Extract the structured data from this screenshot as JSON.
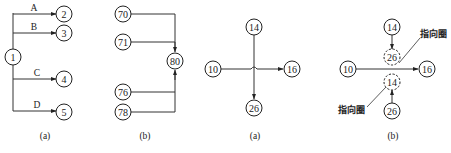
{
  "figures": [
    {
      "id": "fig1a",
      "caption": "(a)",
      "nodes": {
        "n1": "1",
        "n2": "2",
        "n3": "3",
        "n4": "4",
        "n5": "5"
      },
      "edge_labels": {
        "a": "A",
        "b": "B",
        "c": "C",
        "d": "D"
      }
    },
    {
      "id": "fig1b",
      "caption": "(b)",
      "nodes": {
        "n70": "70",
        "n71": "71",
        "n80": "80",
        "n76": "76",
        "n78": "78"
      }
    },
    {
      "id": "fig2a",
      "caption": "(a)",
      "nodes": {
        "n10": "10",
        "n14": "14",
        "n16": "16",
        "n26": "26"
      }
    },
    {
      "id": "fig2b",
      "caption": "(b)",
      "nodes": {
        "n14": "14",
        "n26_ref": "26",
        "n10": "10",
        "n16": "16",
        "n14_ref": "14",
        "n26": "26"
      },
      "annotations": {
        "top": "指向圈",
        "bottom": "指向圈"
      }
    }
  ],
  "colors": {
    "stroke": "#222222",
    "background": "#ffffff"
  }
}
